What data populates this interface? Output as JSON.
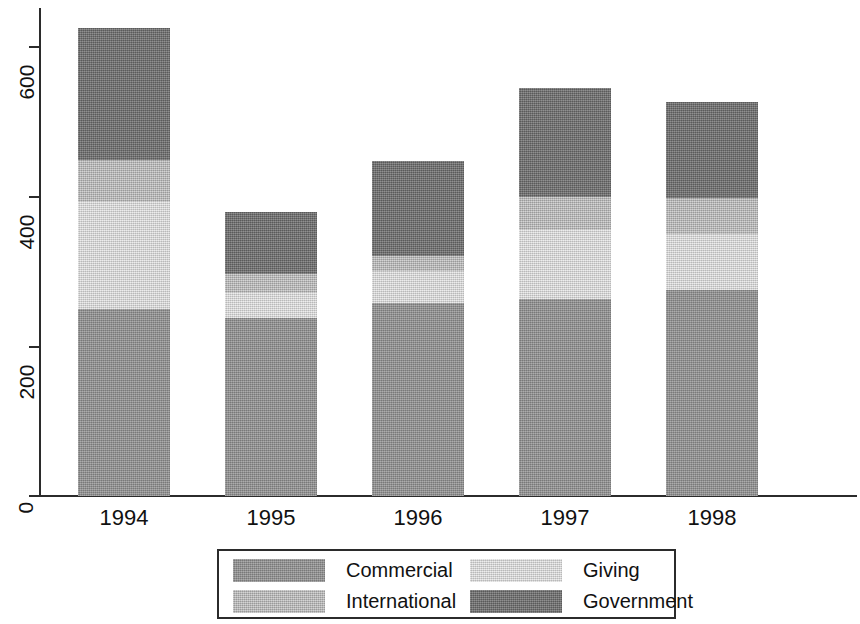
{
  "chart_data": {
    "type": "bar",
    "stacked": true,
    "title": "",
    "subtitle": "",
    "xlabel": "",
    "ylabel": "",
    "categories": [
      "1994",
      "1995",
      "1996",
      "1997",
      "1998"
    ],
    "ylim": [
      0,
      650
    ],
    "yticks": [
      0,
      200,
      400,
      600
    ],
    "ytick_labels": [
      "0",
      "200",
      "400",
      "600"
    ],
    "grid": false,
    "legend_position": "bottom",
    "series": [
      {
        "name": "Commercial",
        "color": "#949494",
        "values": [
          250,
          238,
          258,
          263,
          275
        ]
      },
      {
        "name": "Giving",
        "color": "#dcdcdc",
        "values": [
          143,
          33,
          43,
          93,
          75
        ]
      },
      {
        "name": "International",
        "color": "#bcbcbc",
        "values": [
          56,
          26,
          20,
          44,
          48
        ]
      },
      {
        "name": "Government",
        "color": "#737373",
        "values": [
          176,
          83,
          127,
          145,
          128
        ]
      }
    ],
    "stack_totals": [
      625,
      380,
      448,
      545,
      526
    ],
    "legend_entries": [
      {
        "label": "Commercial",
        "color": "#949494"
      },
      {
        "label": "Giving",
        "color": "#dcdcdc"
      },
      {
        "label": "International",
        "color": "#bcbcbc"
      },
      {
        "label": "Government",
        "color": "#737373"
      }
    ]
  },
  "axis": {
    "y_tick_labels": [
      "600",
      "400",
      "200",
      "0"
    ],
    "x_tick_labels": [
      "1994",
      "1995",
      "1996",
      "1997",
      "1998"
    ]
  }
}
